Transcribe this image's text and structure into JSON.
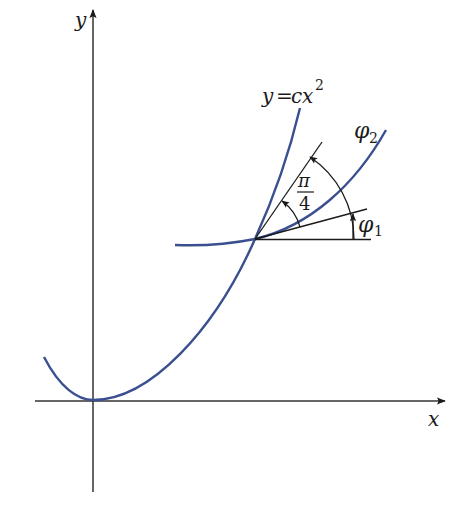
{
  "figure": {
    "axes": {
      "x_label": "x",
      "y_label": "y"
    },
    "curves": {
      "parabola_label": "y = cx²",
      "parabola_label_parts": {
        "lhs": "y",
        "eq": "=",
        "c": "c",
        "x": "x",
        "exp": "2"
      },
      "orthogonal_curve_label": "φ2",
      "orthogonal_curve_parts": {
        "symbol": "φ",
        "sub": "2"
      }
    },
    "angles": {
      "angle_1_label": "φ1",
      "angle_1_parts": {
        "symbol": "φ",
        "sub": "1"
      },
      "angle_between_label": "π/4",
      "angle_between_parts": {
        "numerator": "π",
        "denominator": "4"
      }
    },
    "colors": {
      "curve": "#3a4f8f",
      "line": "#1a1a1a",
      "axis": "#333333"
    }
  }
}
